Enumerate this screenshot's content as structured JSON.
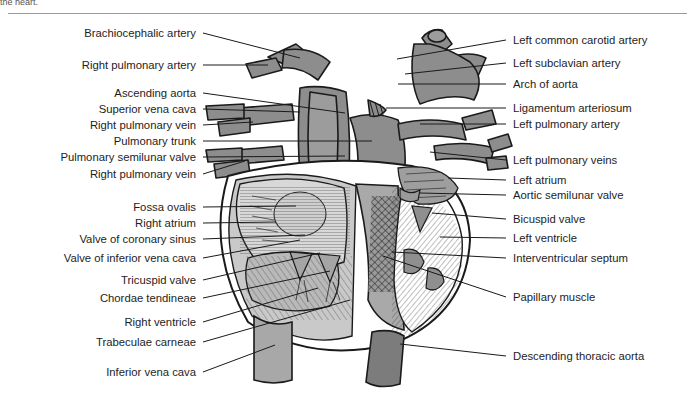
{
  "caption": {
    "text": "the heart."
  },
  "figure": {
    "type": "labeled-anatomical-diagram",
    "colors": {
      "vessel_gray": "#8d8d8d",
      "vessel_dark": "#7c7c7c",
      "vessel_light": "#a8a8a8",
      "muscle_gray": "#bdbdbd",
      "chamber_light": "#d8d8d8",
      "outline": "#1a1a1a",
      "label_text": "#1d1d1d",
      "leader_line": "#1a1a1a",
      "rule": "#9b9b9b",
      "background": "#ffffff"
    }
  },
  "labels_left": [
    {
      "id": "brachiocephalic-artery",
      "text": "Brachiocephalic artery",
      "x": 196,
      "y": 33,
      "lx1": 203,
      "ly1": 33,
      "lx2": 300,
      "ly2": 58
    },
    {
      "id": "right-pulmonary-artery",
      "text": "Right pulmonary artery",
      "x": 196,
      "y": 65,
      "lx1": 203,
      "ly1": 65,
      "lx2": 268,
      "ly2": 65
    },
    {
      "id": "ascending-aorta",
      "text": "Ascending aorta",
      "x": 196,
      "y": 93,
      "lx1": 203,
      "ly1": 93,
      "lx2": 345,
      "ly2": 113
    },
    {
      "id": "superior-vena-cava",
      "text": "Superior vena cava",
      "x": 196,
      "y": 109,
      "lx1": 203,
      "ly1": 109,
      "lx2": 300,
      "ly2": 112
    },
    {
      "id": "right-pulmonary-vein",
      "text": "Right pulmonary vein",
      "x": 196,
      "y": 125,
      "lx1": 203,
      "ly1": 125,
      "lx2": 253,
      "ly2": 122
    },
    {
      "id": "pulmonary-trunk",
      "text": "Pulmonary trunk",
      "x": 196,
      "y": 141,
      "lx1": 203,
      "ly1": 141,
      "lx2": 372,
      "ly2": 141
    },
    {
      "id": "pulmonary-semilunar-valve",
      "text": "Pulmonary semilunar valve",
      "x": 196,
      "y": 157,
      "lx1": 203,
      "ly1": 157,
      "lx2": 345,
      "ly2": 156
    },
    {
      "id": "right-pulmonary-vein-2",
      "text": "Right pulmonary vein",
      "x": 196,
      "y": 174,
      "lx1": 203,
      "ly1": 174,
      "lx2": 245,
      "ly2": 161
    },
    {
      "id": "fossa-ovalis",
      "text": "Fossa ovalis",
      "x": 196,
      "y": 207,
      "lx1": 203,
      "ly1": 207,
      "lx2": 296,
      "ly2": 206
    },
    {
      "id": "right-atrium",
      "text": "Right atrium",
      "x": 196,
      "y": 223,
      "lx1": 203,
      "ly1": 223,
      "lx2": 276,
      "ly2": 222
    },
    {
      "id": "valve-of-coronary-sinus",
      "text": "Valve of coronary sinus",
      "x": 196,
      "y": 239,
      "lx1": 203,
      "ly1": 239,
      "lx2": 305,
      "ly2": 235
    },
    {
      "id": "valve-of-inferior-vena-cava",
      "text": "Valve of inferior vena cava",
      "x": 196,
      "y": 258,
      "lx1": 203,
      "ly1": 258,
      "lx2": 300,
      "ly2": 240
    },
    {
      "id": "tricuspid-valve",
      "text": "Tricuspid valve",
      "x": 196,
      "y": 280,
      "lx1": 203,
      "ly1": 280,
      "lx2": 320,
      "ly2": 253
    },
    {
      "id": "chordae-tendineae",
      "text": "Chordae tendineae",
      "x": 196,
      "y": 298,
      "lx1": 203,
      "ly1": 298,
      "lx2": 330,
      "ly2": 271
    },
    {
      "id": "right-ventricle",
      "text": "Right ventricle",
      "x": 196,
      "y": 322,
      "lx1": 203,
      "ly1": 322,
      "lx2": 318,
      "ly2": 288
    },
    {
      "id": "trabeculae-carneae",
      "text": "Trabeculae carneae",
      "x": 196,
      "y": 342,
      "lx1": 203,
      "ly1": 342,
      "lx2": 350,
      "ly2": 300
    },
    {
      "id": "inferior-vena-cava",
      "text": "Inferior vena cava",
      "x": 196,
      "y": 372,
      "lx1": 203,
      "ly1": 372,
      "lx2": 275,
      "ly2": 345
    }
  ],
  "labels_right": [
    {
      "id": "left-common-carotid-artery",
      "text": "Left common carotid artery",
      "x": 513,
      "y": 40,
      "lx1": 506,
      "ly1": 40,
      "lx2": 397,
      "ly2": 59
    },
    {
      "id": "left-subclavian-artery",
      "text": "Left subclavian artery",
      "x": 513,
      "y": 63,
      "lx1": 506,
      "ly1": 63,
      "lx2": 405,
      "ly2": 74
    },
    {
      "id": "arch-of-aorta",
      "text": "Arch of aorta",
      "x": 513,
      "y": 84,
      "lx1": 506,
      "ly1": 84,
      "lx2": 398,
      "ly2": 84
    },
    {
      "id": "ligamentum-arteriosum",
      "text": "Ligamentum arteriosum",
      "x": 513,
      "y": 108,
      "lx1": 506,
      "ly1": 108,
      "lx2": 386,
      "ly2": 108
    },
    {
      "id": "left-pulmonary-artery",
      "text": "Left pulmonary artery",
      "x": 513,
      "y": 124,
      "lx1": 506,
      "ly1": 124,
      "lx2": 420,
      "ly2": 124
    },
    {
      "id": "left-pulmonary-veins",
      "text": "Left pulmonary veins",
      "x": 513,
      "y": 160,
      "lx1": 506,
      "ly1": 160,
      "lx2": 430,
      "ly2": 152
    },
    {
      "id": "left-atrium",
      "text": "Left atrium",
      "x": 513,
      "y": 180,
      "lx1": 506,
      "ly1": 180,
      "lx2": 448,
      "ly2": 178
    },
    {
      "id": "aortic-semilunar-valve",
      "text": "Aortic semilunar valve",
      "x": 513,
      "y": 195,
      "lx1": 506,
      "ly1": 195,
      "lx2": 420,
      "ly2": 193
    },
    {
      "id": "bicuspid-valve",
      "text": "Bicuspid valve",
      "x": 513,
      "y": 219,
      "lx1": 506,
      "ly1": 219,
      "lx2": 432,
      "ly2": 213
    },
    {
      "id": "left-ventricle",
      "text": "Left ventricle",
      "x": 513,
      "y": 238,
      "lx1": 506,
      "ly1": 238,
      "lx2": 440,
      "ly2": 237
    },
    {
      "id": "interventricular-septum",
      "text": "Interventricular septum",
      "x": 513,
      "y": 258,
      "lx1": 506,
      "ly1": 258,
      "lx2": 392,
      "ly2": 252
    },
    {
      "id": "papillary-muscle",
      "text": "Papillary muscle",
      "x": 513,
      "y": 297,
      "lx1": 506,
      "ly1": 297,
      "lx2": 383,
      "ly2": 256
    },
    {
      "id": "descending-thoracic-aorta",
      "text": "Descending thoracic aorta",
      "x": 513,
      "y": 356,
      "lx1": 506,
      "ly1": 356,
      "lx2": 400,
      "ly2": 344
    }
  ]
}
